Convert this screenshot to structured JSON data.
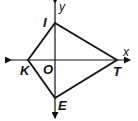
{
  "diagram": {
    "type": "kite on coordinate plane",
    "axes": {
      "x_label": "x",
      "y_label": "y",
      "origin_label": "O"
    },
    "vertices": [
      {
        "name": "I",
        "position": "positive y-axis"
      },
      {
        "name": "T",
        "position": "positive x-axis"
      },
      {
        "name": "E",
        "position": "negative y-axis"
      },
      {
        "name": "K",
        "position": "negative x-axis"
      }
    ],
    "labels": {
      "I": "I",
      "T": "T",
      "E": "E",
      "K": "K"
    },
    "colors": {
      "stroke": "#111111",
      "background": "#ffffff"
    }
  }
}
